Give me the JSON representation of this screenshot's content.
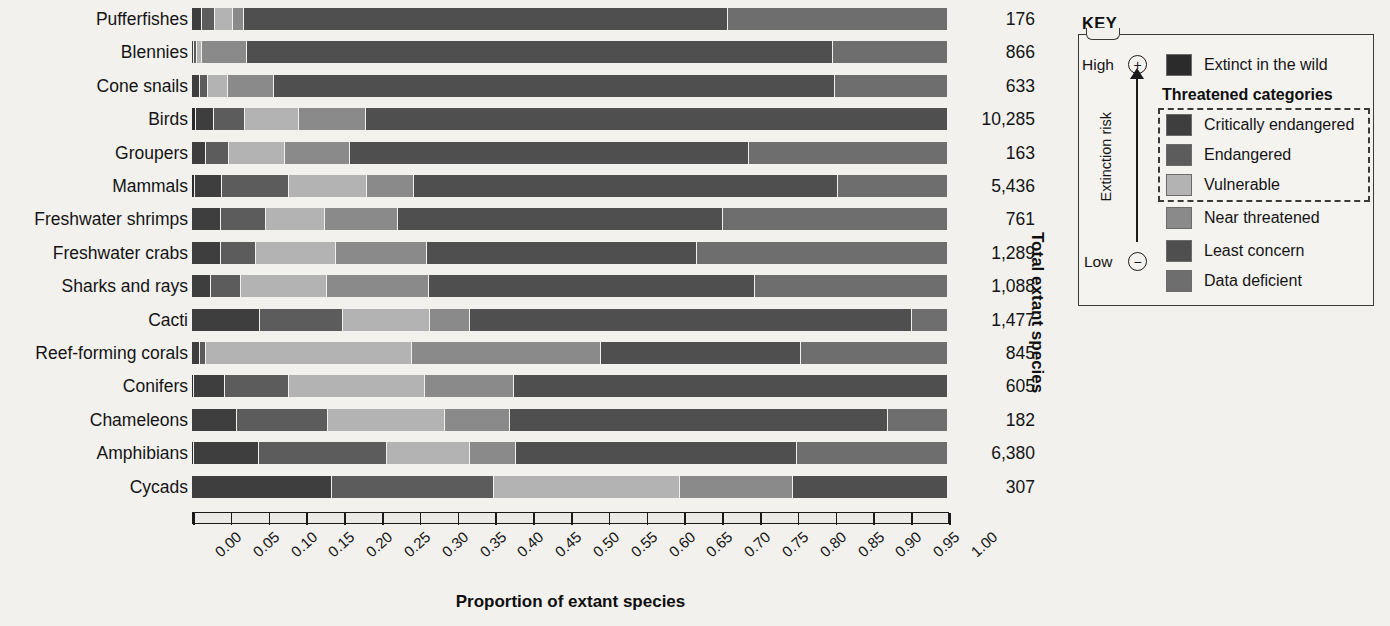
{
  "chart_data": {
    "type": "bar",
    "subtype": "stacked-horizontal-100percent",
    "title": "",
    "xlabel": "Proportion of extant species",
    "ylabel": "Total extant species",
    "xlim": [
      0,
      1
    ],
    "grid": false,
    "legend_position": "right",
    "xticks": [
      "0.00",
      "0.05",
      "0.10",
      "0.15",
      "0.20",
      "0.25",
      "0.30",
      "0.35",
      "0.40",
      "0.45",
      "0.50",
      "0.55",
      "0.60",
      "0.65",
      "0.70",
      "0.75",
      "0.80",
      "0.85",
      "0.90",
      "0.95",
      "1.00"
    ],
    "series": [
      {
        "name": "Extinct in the wild",
        "color": "#2b2b2b"
      },
      {
        "name": "Critically endangered",
        "color": "#3e3e3e"
      },
      {
        "name": "Endangered",
        "color": "#5c5c5c"
      },
      {
        "name": "Vulnerable",
        "color": "#b3b3b3"
      },
      {
        "name": "Near threatened",
        "color": "#8a8a8a"
      },
      {
        "name": "Least concern",
        "color": "#4f4f4f"
      },
      {
        "name": "Data deficient",
        "color": "#6e6e6e"
      }
    ],
    "categories": [
      "Pufferfishes",
      "Blennies",
      "Cone snails",
      "Birds",
      "Groupers",
      "Mammals",
      "Freshwater shrimps",
      "Freshwater crabs",
      "Sharks and rays",
      "Cacti",
      "Reef-forming corals",
      "Conifers",
      "Chameleons",
      "Amphibians",
      "Cycads"
    ],
    "totals": [
      "176",
      "866",
      "633",
      "10,285",
      "163",
      "5,436",
      "761",
      "1,289",
      "1,088",
      "1,477",
      "845",
      "605",
      "182",
      "6,380",
      "307"
    ],
    "rows": [
      {
        "category": "Pufferfishes",
        "total": "176",
        "values": {
          "extinct_in_the_wild": 0.0,
          "critically_endangered": 0.013,
          "endangered": 0.018,
          "vulnerable": 0.023,
          "near_threatened": 0.015,
          "least_concern": 0.64,
          "data_deficient": 0.291
        }
      },
      {
        "category": "Blennies",
        "total": "866",
        "values": {
          "extinct_in_the_wild": 0.0,
          "critically_endangered": 0.003,
          "endangered": 0.004,
          "vulnerable": 0.006,
          "near_threatened": 0.06,
          "least_concern": 0.775,
          "data_deficient": 0.152
        }
      },
      {
        "category": "Cone snails",
        "total": "633",
        "values": {
          "extinct_in_the_wild": 0.0,
          "critically_endangered": 0.01,
          "endangered": 0.011,
          "vulnerable": 0.027,
          "near_threatened": 0.06,
          "least_concern": 0.742,
          "data_deficient": 0.15
        }
      },
      {
        "category": "Birds",
        "total": "10,285",
        "values": {
          "extinct_in_the_wild": 0.005,
          "critically_endangered": 0.024,
          "endangered": 0.041,
          "vulnerable": 0.072,
          "near_threatened": 0.088,
          "least_concern": 0.77,
          "data_deficient": 0.0
        }
      },
      {
        "category": "Groupers",
        "total": "163",
        "values": {
          "extinct_in_the_wild": 0.0,
          "critically_endangered": 0.018,
          "endangered": 0.031,
          "vulnerable": 0.074,
          "near_threatened": 0.086,
          "least_concern": 0.528,
          "data_deficient": 0.263
        }
      },
      {
        "category": "Mammals",
        "total": "5,436",
        "values": {
          "extinct_in_the_wild": 0.004,
          "critically_endangered": 0.036,
          "endangered": 0.088,
          "vulnerable": 0.104,
          "near_threatened": 0.062,
          "least_concern": 0.56,
          "data_deficient": 0.146
        }
      },
      {
        "category": "Freshwater shrimps",
        "total": "761",
        "values": {
          "extinct_in_the_wild": 0.0,
          "critically_endangered": 0.039,
          "endangered": 0.059,
          "vulnerable": 0.078,
          "near_threatened": 0.097,
          "least_concern": 0.43,
          "data_deficient": 0.297
        }
      },
      {
        "category": "Freshwater crabs",
        "total": "1,289",
        "values": {
          "extinct_in_the_wild": 0.0,
          "critically_endangered": 0.038,
          "endangered": 0.047,
          "vulnerable": 0.106,
          "near_threatened": 0.12,
          "least_concern": 0.357,
          "data_deficient": 0.332
        }
      },
      {
        "category": "Sharks and rays",
        "total": "1,088",
        "values": {
          "extinct_in_the_wild": 0.0,
          "critically_endangered": 0.025,
          "endangered": 0.04,
          "vulnerable": 0.113,
          "near_threatened": 0.135,
          "least_concern": 0.432,
          "data_deficient": 0.255
        }
      },
      {
        "category": "Cacti",
        "total": "1,477",
        "values": {
          "extinct_in_the_wild": 0.0,
          "critically_endangered": 0.09,
          "endangered": 0.11,
          "vulnerable": 0.115,
          "near_threatened": 0.053,
          "least_concern": 0.585,
          "data_deficient": 0.047
        }
      },
      {
        "category": "Reef-forming corals",
        "total": "845",
        "values": {
          "extinct_in_the_wild": 0.0,
          "critically_endangered": 0.011,
          "endangered": 0.008,
          "vulnerable": 0.272,
          "near_threatened": 0.25,
          "least_concern": 0.265,
          "data_deficient": 0.194
        }
      },
      {
        "category": "Conifers",
        "total": "605",
        "values": {
          "extinct_in_the_wild": 0.003,
          "critically_endangered": 0.04,
          "endangered": 0.085,
          "vulnerable": 0.18,
          "near_threatened": 0.118,
          "least_concern": 0.574,
          "data_deficient": 0.0
        }
      },
      {
        "category": "Chameleons",
        "total": "182",
        "values": {
          "extinct_in_the_wild": 0.0,
          "critically_endangered": 0.06,
          "endangered": 0.12,
          "vulnerable": 0.155,
          "near_threatened": 0.085,
          "least_concern": 0.5,
          "data_deficient": 0.08
        }
      },
      {
        "category": "Amphibians",
        "total": "6,380",
        "values": {
          "extinct_in_the_wild": 0.003,
          "critically_endangered": 0.085,
          "endangered": 0.17,
          "vulnerable": 0.11,
          "near_threatened": 0.06,
          "least_concern": 0.372,
          "data_deficient": 0.2
        }
      },
      {
        "category": "Cycads",
        "total": "307",
        "values": {
          "extinct_in_the_wild": 0.0,
          "critically_endangered": 0.185,
          "endangered": 0.215,
          "vulnerable": 0.245,
          "near_threatened": 0.15,
          "least_concern": 0.205,
          "data_deficient": 0.0
        }
      }
    ]
  },
  "axis": {
    "x_title": "Proportion of extant species",
    "y_title": "Total extant species"
  },
  "key": {
    "title": "KEY",
    "risk_axis_label": "Extinction risk",
    "high_label": "High",
    "low_label": "Low",
    "high_symbol": "+",
    "low_symbol": "−",
    "threatened_header": "Threatened categories",
    "items": [
      {
        "label": "Extinct in the wild",
        "color": "#2b2b2b"
      },
      {
        "label": "Critically endangered",
        "color": "#3e3e3e"
      },
      {
        "label": "Endangered",
        "color": "#5c5c5c"
      },
      {
        "label": "Vulnerable",
        "color": "#b3b3b3"
      },
      {
        "label": "Near threatened",
        "color": "#8a8a8a"
      },
      {
        "label": "Least concern",
        "color": "#4f4f4f"
      },
      {
        "label": "Data deficient",
        "color": "#6e6e6e"
      }
    ]
  }
}
